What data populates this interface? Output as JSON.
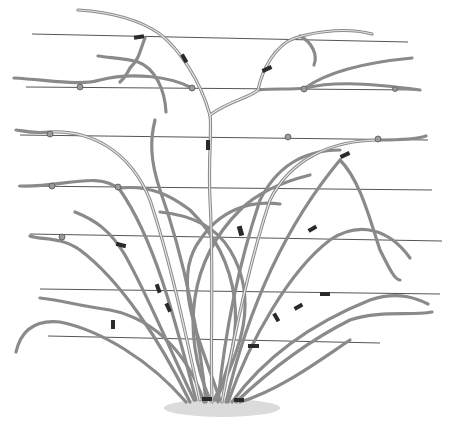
{
  "illustration": {
    "subject": "trained shrub / climbing plant tied to horizontal support wires",
    "wire_count": 7,
    "colors": {
      "background": "#ffffff",
      "wire": "#555555",
      "cane": "#8a8a8a",
      "tie": "#2a2a2a",
      "ground": "#bdbdbd"
    }
  }
}
